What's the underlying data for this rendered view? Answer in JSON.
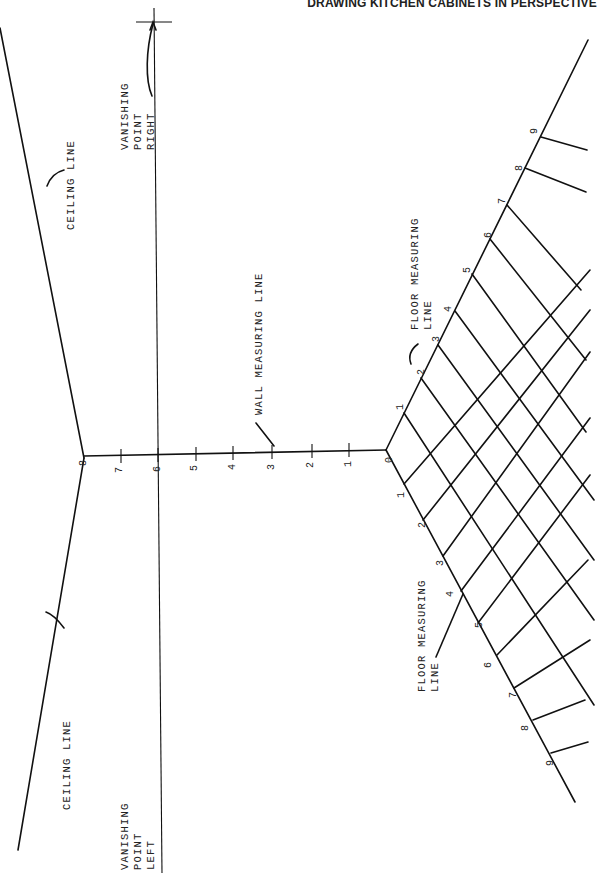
{
  "header": {
    "title": "DRAWING KITCHEN CABINETS IN PERSPECTIVE"
  },
  "labels": {
    "vanishing_point_right": [
      "VANISHING",
      "POINT",
      "RIGHT"
    ],
    "vanishing_point_left": [
      "VANISHING",
      "POINT",
      "LEFT"
    ],
    "ceiling_line_upper": "CEILING LINE",
    "ceiling_line_lower": "CEILING LINE",
    "wall_measuring_line": "WALL MEASURING LINE",
    "floor_measuring_line_upper": [
      "FLOOR MEASURING",
      "LINE"
    ],
    "floor_measuring_line_lower": [
      "FLOOR MEASURING",
      "LINE"
    ]
  },
  "wall_scale": {
    "ticks": [
      "0",
      "1",
      "2",
      "3",
      "4",
      "5",
      "6",
      "7",
      "8"
    ]
  },
  "floor_scale_upper": {
    "ticks": [
      "1",
      "2",
      "3",
      "4",
      "5",
      "6",
      "7",
      "8",
      "9"
    ]
  },
  "floor_scale_lower": {
    "ticks": [
      "1",
      "2",
      "3",
      "4",
      "5",
      "6",
      "7",
      "8",
      "9"
    ]
  },
  "orientation": "rotated 90° counter-clockwise (page printed sideways)"
}
